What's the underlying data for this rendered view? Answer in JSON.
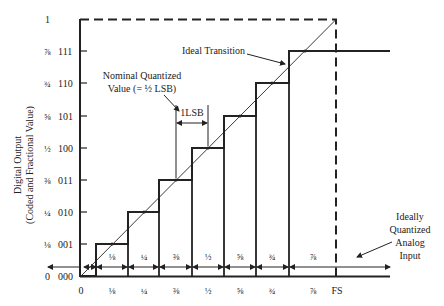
{
  "diagram": {
    "y_axis_label_line1": "Digital Output",
    "y_axis_label_line2": "(Coded and Fractional Value)",
    "y_ticks": [
      {
        "fraction": "0",
        "code": "000"
      },
      {
        "fraction": "⅛",
        "code": "001"
      },
      {
        "fraction": "¼",
        "code": "010"
      },
      {
        "fraction": "⅜",
        "code": "011"
      },
      {
        "fraction": "½",
        "code": "100"
      },
      {
        "fraction": "⅝",
        "code": "101"
      },
      {
        "fraction": "¾",
        "code": "110"
      },
      {
        "fraction": "⅞",
        "code": "111"
      },
      {
        "fraction": "1",
        "code": ""
      }
    ],
    "x_ticks": [
      "0",
      "⅛",
      "¼",
      "⅜",
      "½",
      "⅝",
      "¾",
      "⅞",
      "FS"
    ],
    "interval_labels": [
      "⅛",
      "¼",
      "⅜",
      "½",
      "⅝",
      "¾",
      "⅞"
    ],
    "annotations": {
      "ideal_transition": "Ideal Transition",
      "nominal_line1": "Nominal Quantized",
      "nominal_line2": "Value (= ½ LSB)",
      "lsb": "1LSB",
      "analog_line1": "Ideally",
      "analog_line2": "Quantized",
      "analog_line3": "Analog",
      "analog_line4": "Input"
    }
  }
}
